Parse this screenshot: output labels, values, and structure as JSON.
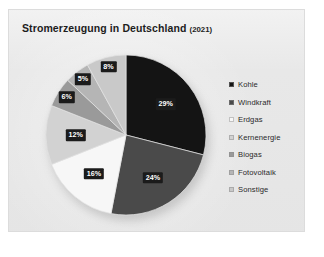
{
  "card": {
    "background_color": "#e8e8e8",
    "border_color": "#dcdcdc"
  },
  "chart_title": {
    "main": "Stromerzeugung in Deutschland",
    "year": "(2021)"
  },
  "legend": {
    "position": "right",
    "items": [
      {
        "label": "Kohle",
        "color": "#141414"
      },
      {
        "label": "Windkraft",
        "color": "#4a4a4a"
      },
      {
        "label": "Erdgas",
        "color": "#f7f7f7"
      },
      {
        "label": "Kernenergie",
        "color": "#d2d2d2"
      },
      {
        "label": "Biogas",
        "color": "#9a9a9a"
      },
      {
        "label": "Fotovoltaik",
        "color": "#b5b5b5"
      },
      {
        "label": "Sonstige",
        "color": "#c9c9c9"
      }
    ]
  },
  "slice_labels": [
    {
      "text": "29%"
    },
    {
      "text": "24%"
    },
    {
      "text": "16%"
    },
    {
      "text": "12%"
    },
    {
      "text": "6%"
    },
    {
      "text": "5%"
    },
    {
      "text": "8%"
    }
  ],
  "chart_data": {
    "type": "pie",
    "title": "Stromerzeugung in Deutschland (2021)",
    "xlabel": "",
    "ylabel": "",
    "unit": "%",
    "legend_position": "right",
    "grid": false,
    "start_angle_deg": 0,
    "direction": "clockwise",
    "categories": [
      "Kohle",
      "Windkraft",
      "Erdgas",
      "Kernenergie",
      "Biogas",
      "Fotovoltaik",
      "Sonstige"
    ],
    "values": [
      29,
      24,
      16,
      12,
      6,
      5,
      8
    ],
    "data_labels": [
      "29%",
      "24%",
      "16%",
      "12%",
      "6%",
      "5%",
      "8%"
    ],
    "colors": [
      "#141414",
      "#4a4a4a",
      "#f7f7f7",
      "#d2d2d2",
      "#9a9a9a",
      "#b5b5b5",
      "#c9c9c9"
    ]
  }
}
